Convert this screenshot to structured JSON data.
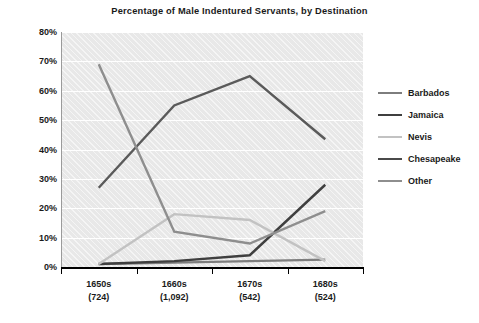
{
  "chart_data": {
    "type": "line",
    "title": "Percentage of Male Indentured Servants, by Destination",
    "xlabel": "",
    "ylabel": "",
    "ylim": [
      0,
      80
    ],
    "yticks": [
      "0%",
      "10%",
      "20%",
      "30%",
      "40%",
      "50%",
      "60%",
      "70%",
      "80%"
    ],
    "ytick_values": [
      0,
      10,
      20,
      30,
      40,
      50,
      60,
      70,
      80
    ],
    "grid": true,
    "legend_position": "right",
    "categories": [
      "1650s",
      "1660s",
      "1670s",
      "1680s"
    ],
    "category_counts": [
      "(724)",
      "(1,092)",
      "(542)",
      "(524)"
    ],
    "series": [
      {
        "name": "Barbados",
        "values": [
          1,
          1.5,
          2,
          2.5
        ],
        "color": "#7d7d7d"
      },
      {
        "name": "Jamaica",
        "values": [
          1,
          2,
          4,
          28
        ],
        "color": "#3f3f3f"
      },
      {
        "name": "Nevis",
        "values": [
          1,
          18,
          16,
          2
        ],
        "color": "#c2c2c2"
      },
      {
        "name": "Chesapeake",
        "values": [
          27,
          55,
          65,
          43.5
        ],
        "color": "#5a5a5a"
      },
      {
        "name": "Other",
        "values": [
          69,
          12,
          8,
          19
        ],
        "color": "#8e8e8e"
      }
    ]
  },
  "legend": {
    "items": [
      {
        "label": "Barbados",
        "color": "#7d7d7d"
      },
      {
        "label": "Jamaica",
        "color": "#3f3f3f"
      },
      {
        "label": "Nevis",
        "color": "#c2c2c2"
      },
      {
        "label": "Chesapeake",
        "color": "#4a4a4a"
      },
      {
        "label": "Other",
        "color": "#8e8e8e"
      }
    ]
  },
  "colors": {
    "plot_background": "#e8e8e8",
    "gridline": "#ffffff",
    "axis": "#000000",
    "text": "#1a1a1a"
  }
}
